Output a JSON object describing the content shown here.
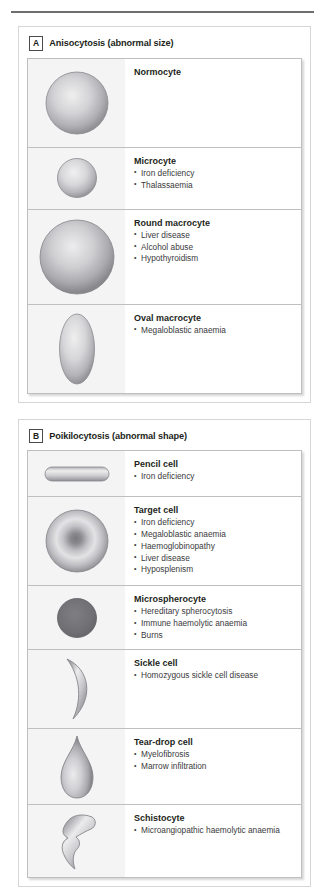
{
  "figure": {
    "panels": [
      {
        "letter": "A",
        "title": "Anisocytosis (abnormal size)",
        "rows": [
          {
            "shape": "circle-large",
            "name": "Normocyte",
            "bullets": []
          },
          {
            "shape": "circle-small",
            "name": "Microcyte",
            "bullets": [
              "Iron deficiency",
              "Thalassaemia"
            ]
          },
          {
            "shape": "circle-xlarge",
            "name": "Round macrocyte",
            "bullets": [
              "Liver disease",
              "Alcohol abuse",
              "Hypothyroidism"
            ]
          },
          {
            "shape": "oval",
            "name": "Oval macrocyte",
            "bullets": [
              "Megaloblastic anaemia"
            ]
          }
        ]
      },
      {
        "letter": "B",
        "title": "Poikilocytosis (abnormal shape)",
        "rows": [
          {
            "shape": "pencil",
            "name": "Pencil cell",
            "bullets": [
              "Iron deficiency"
            ]
          },
          {
            "shape": "target",
            "name": "Target cell",
            "bullets": [
              "Iron deficiency",
              "Megaloblastic anaemia",
              "Haemoglobinopathy",
              "Liver disease",
              "Hyposplenism"
            ]
          },
          {
            "shape": "spherocyte",
            "name": "Microspherocyte",
            "bullets": [
              "Hereditary spherocytosis",
              "Immune haemolytic anaemia",
              "Burns"
            ]
          },
          {
            "shape": "sickle",
            "name": "Sickle cell",
            "bullets": [
              "Homozygous sickle cell disease"
            ]
          },
          {
            "shape": "teardrop",
            "name": "Tear-drop cell",
            "bullets": [
              "Myelofibrosis",
              "Marrow infiltration"
            ]
          },
          {
            "shape": "schistocyte",
            "name": "Schistocyte",
            "bullets": [
              "Microangiopathic haemolytic anaemia"
            ]
          }
        ]
      }
    ]
  },
  "colors": {
    "cell_light": "#e8e8ea",
    "cell_mid": "#b7b7ba",
    "cell_dark": "#8e8e92",
    "cell_solid": "#6f6f73",
    "art_background": "#f4f4f5",
    "border": "#bfbfc1",
    "text": "#231f20",
    "rule": "#6e6e70"
  }
}
